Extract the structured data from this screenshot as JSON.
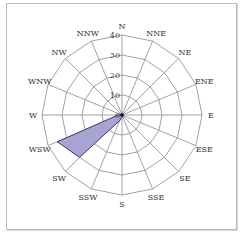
{
  "chart_data": {
    "type": "radar",
    "title": "",
    "directions": [
      "N",
      "NNE",
      "NE",
      "ENE",
      "E",
      "ESE",
      "SE",
      "SSE",
      "S",
      "SSW",
      "SW",
      "WSW",
      "W",
      "WNW",
      "NW",
      "NNW"
    ],
    "series": [
      {
        "name": "frequency",
        "values": [
          0,
          0,
          0,
          0,
          0,
          0,
          0,
          1,
          1,
          3,
          30,
          35,
          2,
          0,
          0,
          0
        ],
        "fill": "#a7a3d3",
        "stroke": "#2a2a5a"
      }
    ],
    "radial_ticks": [
      "0",
      "10",
      "20",
      "30",
      "40"
    ],
    "rlim": [
      0,
      40
    ],
    "grid": true
  }
}
